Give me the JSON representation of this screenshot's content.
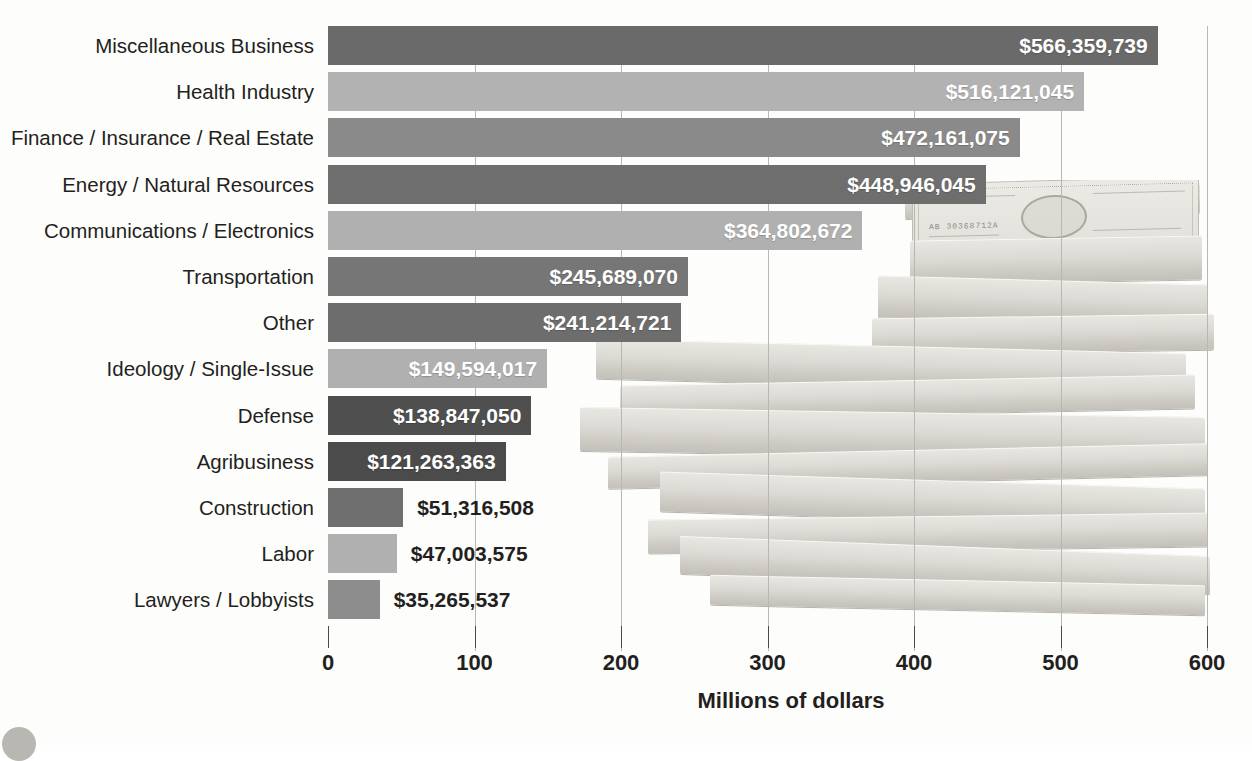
{
  "chart_data": {
    "type": "bar",
    "orientation": "horizontal",
    "title": "",
    "xlabel": "Millions of dollars",
    "ylabel": "",
    "xlim": [
      0,
      600
    ],
    "xticks": [
      0,
      100,
      200,
      300,
      400,
      500,
      600
    ],
    "xtick_labels": [
      "0",
      "100",
      "200",
      "300",
      "400",
      "500",
      "600"
    ],
    "grid": "vertical",
    "legend": "none",
    "units": "millions of dollars",
    "categories": [
      "Miscellaneous Business",
      "Health Industry",
      "Finance / Insurance / Real Estate",
      "Energy / Natural Resources",
      "Communications / Electronics",
      "Transportation",
      "Other",
      "Ideology / Single-Issue",
      "Defense",
      "Agribusiness",
      "Construction",
      "Labor",
      "Lawyers / Lobbyists"
    ],
    "values": [
      566.359739,
      516.121045,
      472.161075,
      448.946045,
      364.802672,
      245.68907,
      241.214721,
      149.594017,
      138.84705,
      121.263363,
      51.316508,
      47.003575,
      35.265537
    ],
    "data_labels": [
      "$566,359,739",
      "$516,121,045",
      "$472,161,075",
      "$448,946,045",
      "$364,802,672",
      "$245,689,070",
      "$241,214,721",
      "$149,594,017",
      "$138,847,050",
      "$121,263,363",
      "$51,316,508",
      "$47,003,575",
      "$35,265,537"
    ],
    "bar_colors": [
      "#6a6a6a",
      "#b2b2b2",
      "#8a8a8a",
      "#6e6e6e",
      "#b0b0b0",
      "#767676",
      "#6d6d6d",
      "#b0b0b0",
      "#4f4f4f",
      "#4b4b4b",
      "#6f6f6f",
      "#b0b0b0",
      "#8d8d8d"
    ],
    "label_placement": [
      "inside",
      "inside",
      "inside",
      "inside",
      "inside",
      "inside",
      "inside",
      "inside",
      "inside",
      "inside",
      "outside",
      "outside",
      "outside"
    ],
    "axis_color": "#4b4a47",
    "gridline_color": "#b9b7b1",
    "text_color": "#231f20"
  },
  "background": {
    "image_description": "stacked-hundred-dollar-bills-photo",
    "bill_denomination": "100",
    "bill_serial": "AB 30368712A"
  }
}
